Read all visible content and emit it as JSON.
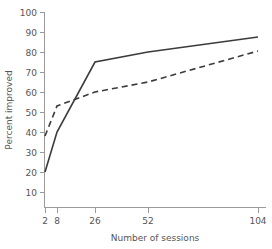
{
  "chart_data": {
    "type": "line",
    "title": "",
    "xlabel": "Number of sessions",
    "ylabel": "Percent improved",
    "x": [
      2,
      8,
      26,
      52,
      104
    ],
    "xtick_labels": [
      "2",
      "8",
      "26",
      "52",
      "104"
    ],
    "ytick_labels": [
      "10",
      "20",
      "30",
      "40",
      "50",
      "60",
      "70",
      "80",
      "90",
      "100"
    ],
    "ylim": [
      5,
      100
    ],
    "ytick_values": [
      10,
      20,
      30,
      40,
      50,
      60,
      70,
      80,
      90,
      100
    ],
    "grid": false,
    "legend": "none",
    "series": [
      {
        "name": "solid",
        "style": "solid",
        "color": "#3b3b3b",
        "values": [
          20,
          40,
          75,
          80,
          87.5
        ]
      },
      {
        "name": "dashed",
        "style": "dashed",
        "color": "#3b3b3b",
        "values": [
          38,
          53,
          60,
          65,
          80.5
        ]
      }
    ]
  },
  "axes": {
    "x_title": "Number of sessions",
    "y_title": "Percent improved",
    "tick_color": "#9a9a9a",
    "label_color": "#555555"
  },
  "ticks": {
    "x": [
      {
        "label": "2",
        "px": 45
      },
      {
        "label": "8",
        "px": 57
      },
      {
        "label": "26",
        "px": 95
      },
      {
        "label": "52",
        "px": 148
      },
      {
        "label": "104",
        "px": 258
      }
    ],
    "y": [
      {
        "label": "100",
        "px": 12
      },
      {
        "label": "90",
        "px": 32
      },
      {
        "label": "80",
        "px": 52
      },
      {
        "label": "70",
        "px": 72
      },
      {
        "label": "60",
        "px": 92
      },
      {
        "label": "50",
        "px": 112
      },
      {
        "label": "40",
        "px": 132
      },
      {
        "label": "30",
        "px": 152
      },
      {
        "label": "20",
        "px": 172
      },
      {
        "label": "10",
        "px": 192
      }
    ]
  }
}
